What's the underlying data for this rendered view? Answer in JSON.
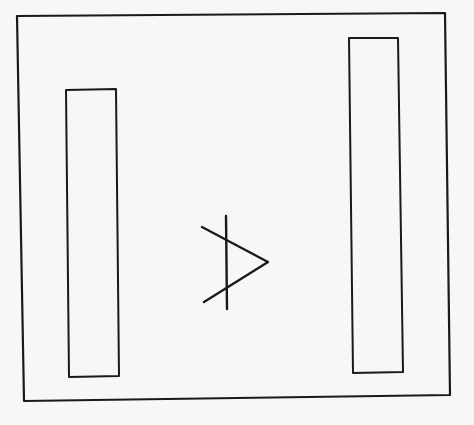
{
  "figure": {
    "background": "#f7f7f7",
    "ink_color": "#1a1a1a",
    "paper_color": "#ffffff",
    "frame": {
      "points": "17,16 445,13 450,395 24,401",
      "stroke_width": 2.2
    },
    "left_bar": {
      "points": "66,90 116,89 119,376 69,377",
      "stroke_width": 2
    },
    "right_bar": {
      "points": "349,38 398,38 403,372 353,373",
      "stroke_width": 2
    },
    "center_symbol": {
      "name": "arrowhead-with-vertical-line",
      "chevron_points": "202,227 268,262 204,302",
      "vertical_line": {
        "x1": 226,
        "y1": 216,
        "x2": 227,
        "y2": 309
      },
      "stroke_width": 2.4
    }
  }
}
